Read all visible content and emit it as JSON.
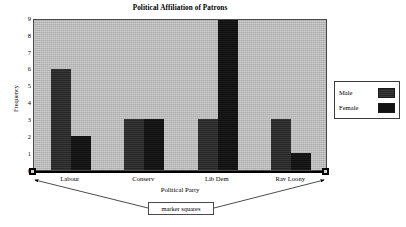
{
  "chart_data": {
    "type": "bar",
    "title": "Political Affiliation of Patrons",
    "xlabel": "Political Party",
    "ylabel": "Frequency",
    "categories": [
      "Labour",
      "Conserv",
      "Lib Dem",
      "Rav Loony"
    ],
    "series": [
      {
        "name": "Male",
        "values": [
          6,
          3,
          3,
          3
        ],
        "color": "#2b2b2b"
      },
      {
        "name": "Female",
        "values": [
          2,
          3,
          9,
          1
        ],
        "color": "#131313"
      }
    ],
    "ylim": [
      0,
      9
    ],
    "yticks": [
      0,
      1,
      2,
      3,
      4,
      5,
      6,
      7,
      8,
      9
    ],
    "ytick_labels": [
      "0",
      "1",
      "2",
      "3",
      "4",
      "5",
      "6",
      "7",
      "8",
      "9"
    ],
    "grid": false,
    "legend_position": "right",
    "plot_background": "#bdbdbd",
    "figure_background": "#ffffff"
  },
  "legend": {
    "entries": [
      {
        "label": "Male",
        "swatch": "male-swatch"
      },
      {
        "label": "Female",
        "swatch": "female-swatch"
      }
    ]
  },
  "annotation": {
    "text": "marker squares"
  },
  "markers": {
    "left_label": "axis-origin-marker",
    "right_label": "axis-end-marker"
  }
}
